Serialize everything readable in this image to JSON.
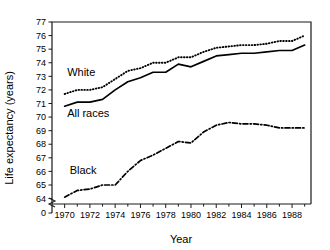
{
  "chart_data": {
    "type": "line",
    "title": "",
    "xlabel": "Year",
    "ylabel": "Life expectancy (years)",
    "xlim": [
      1969,
      1989.5
    ],
    "ylim": [
      63.6,
      77
    ],
    "grid": false,
    "legend_position": "inline-labels",
    "axis_break": {
      "present": true,
      "between": [
        0,
        63.6
      ],
      "zero_tick_label": "0"
    },
    "x_tick_labels": [
      "1970",
      "1972",
      "1974",
      "1976",
      "1978",
      "1980",
      "1982",
      "1984",
      "1986",
      "1988"
    ],
    "x_ticks_major": [
      1970,
      1972,
      1974,
      1976,
      1978,
      1980,
      1982,
      1984,
      1986,
      1988
    ],
    "x_ticks_minor": [
      1971,
      1973,
      1975,
      1977,
      1979,
      1981,
      1983,
      1985,
      1987,
      1989
    ],
    "y_tick_labels": [
      "64",
      "65",
      "66",
      "67",
      "68",
      "69",
      "70",
      "71",
      "72",
      "73",
      "74",
      "75",
      "76",
      "77"
    ],
    "y_ticks": [
      64,
      65,
      66,
      67,
      68,
      69,
      70,
      71,
      72,
      73,
      74,
      75,
      76,
      77
    ],
    "x": [
      1970,
      1971,
      1972,
      1973,
      1974,
      1975,
      1976,
      1977,
      1978,
      1979,
      1980,
      1981,
      1982,
      1983,
      1984,
      1985,
      1986,
      1987,
      1988,
      1989
    ],
    "series": [
      {
        "name": "White",
        "label": "White",
        "style": "dotted",
        "values": [
          71.7,
          72.0,
          72.0,
          72.2,
          72.8,
          73.4,
          73.6,
          74.0,
          74.0,
          74.4,
          74.4,
          74.8,
          75.1,
          75.2,
          75.3,
          75.3,
          75.4,
          75.6,
          75.6,
          76.0
        ]
      },
      {
        "name": "All races",
        "label": "All races",
        "style": "solid",
        "values": [
          70.8,
          71.1,
          71.1,
          71.3,
          72.0,
          72.6,
          72.9,
          73.3,
          73.3,
          73.9,
          73.7,
          74.1,
          74.5,
          74.6,
          74.7,
          74.7,
          74.8,
          74.9,
          74.9,
          75.3
        ]
      },
      {
        "name": "Black",
        "label": "Black",
        "style": "dashdot",
        "values": [
          64.1,
          64.6,
          64.7,
          65.0,
          65.0,
          66.0,
          66.8,
          67.2,
          67.7,
          68.2,
          68.1,
          68.9,
          69.4,
          69.6,
          69.5,
          69.5,
          69.4,
          69.2,
          69.2,
          69.2
        ]
      }
    ],
    "inline_labels": [
      {
        "text": "White",
        "x": 1970.2,
        "y": 73.0
      },
      {
        "text": "All races",
        "x": 1970.2,
        "y": 70.0
      },
      {
        "text": "Black",
        "x": 1970.4,
        "y": 65.8
      }
    ]
  }
}
